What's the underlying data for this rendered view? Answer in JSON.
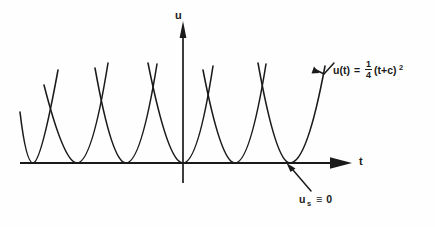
{
  "figure": {
    "background_color": "#fefefe",
    "curve_color": "#1a1a1a",
    "axis_color": "#1a1a1a"
  },
  "axes": {
    "vertical_label": "u",
    "horizontal_label": "t",
    "vertical_axis_name": "u-axis",
    "horizontal_axis_name": "t-axis"
  },
  "annotations": {
    "formula": {
      "lhs": "u(t)",
      "equals": "=",
      "numerator": "1",
      "denominator": "4",
      "base": "(t+c)",
      "exponent": "2",
      "full_text": "u(t) = 1/4(t+c)^2"
    },
    "steady_state": {
      "symbol": "u",
      "subscript": "s",
      "relation": "≡",
      "value": "0",
      "full_text": "u_s ≡ 0"
    }
  },
  "chart_data": {
    "type": "line",
    "title": "",
    "xlabel": "t",
    "ylabel": "u",
    "grid": false,
    "legend": "none",
    "axis_origin_px": [
      183,
      163
    ],
    "xlim_px": [
      20,
      350
    ],
    "ylim_px": [
      22,
      163
    ],
    "series": [
      {
        "name": "parabola-c1",
        "vertex_px": [
          33,
          163
        ],
        "path": "M 20,112 Q 26,163 33,163 Q 41,163 58,70",
        "clipped": true
      },
      {
        "name": "parabola-c2",
        "vertex_px": [
          77,
          163
        ],
        "path": "M 44,85 Q 64,163 77,163 Q 92,163 108,63"
      },
      {
        "name": "parabola-c3",
        "vertex_px": [
          126,
          163
        ],
        "path": "M 95,68 Q 112,163 126,163 Q 141,163 157,64"
      },
      {
        "name": "parabola-c4",
        "vertex_px": [
          183,
          163
        ],
        "path": "M 148,63 Q 168,163 183,163 Q 198,163 213,66"
      },
      {
        "name": "parabola-c5",
        "vertex_px": [
          235,
          163
        ],
        "path": "M 203,70 Q 221,163 235,163 Q 250,163 266,64"
      },
      {
        "name": "parabola-c6",
        "vertex_px": [
          290,
          163
        ],
        "path": "M 258,63 Q 276,163 290,163 Q 307,163 325,66"
      },
      {
        "name": "singular-solution-line",
        "note": "t-axis, u_s = 0",
        "path": "M 20,163 L 350,163"
      }
    ],
    "pointers": [
      {
        "name": "formula-pointer",
        "target_px": [
          322,
          78
        ],
        "path": "M 332,65 L 325,74 L 318,71 L 325,80"
      },
      {
        "name": "steady-state-pointer",
        "target_px": [
          290,
          164
        ],
        "path": "M 310,192 L 292,170"
      }
    ]
  }
}
